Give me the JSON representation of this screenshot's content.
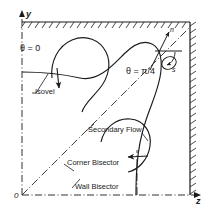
{
  "figure": {
    "axes": {
      "y_label": "y",
      "z_label": "z",
      "origin_label": "0"
    },
    "annotations": {
      "theta_zero": "θ = 0",
      "theta_pi_over_4": "θ = π/4",
      "isovel": "Isovel",
      "secondary_flow": "Secondary Flow",
      "corner_bisector": "Corner Bisector",
      "wall_bisector": "Wall Bisector",
      "normal_coord": "n",
      "tangential_coord": "s"
    },
    "colors": {
      "line": "#1a1a1a",
      "background": "#ffffff",
      "hatch": "#1a1a1a"
    }
  }
}
